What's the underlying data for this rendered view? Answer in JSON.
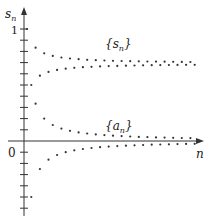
{
  "chart_data": {
    "type": "scatter",
    "title": "",
    "xlabel": "n",
    "ylabel": "s_n",
    "y_tick_labels": [
      "0",
      "1"
    ],
    "ylim": [
      -0.65,
      1.25
    ],
    "x_count": 40,
    "series": [
      {
        "name": "{s_n}",
        "label_text": "{s",
        "label_sub": "n",
        "description": "partial sums of alternating harmonic series, converging to ln 2",
        "formula": "s_n = sum_{k=1..n} (-1)^(k-1)/k"
      },
      {
        "name": "{a_n}",
        "label_text": "{a",
        "label_sub": "n",
        "description": "terms (-1)^(n-1)/n, converging to 0",
        "formula": "a_n = (-1)^(n-1)/n"
      }
    ],
    "sample_values": {
      "s": [
        1,
        0.5,
        0.833,
        0.583,
        0.783,
        0.617,
        0.76,
        0.635,
        0.746,
        0.646
      ],
      "a": [
        1,
        -0.5,
        0.333,
        -0.25,
        0.2,
        -0.167,
        0.143,
        -0.125,
        0.111,
        -0.1
      ]
    },
    "colors": {
      "axis": "#333333",
      "dots": "#333333"
    }
  },
  "labels": {
    "y_axis": "s",
    "y_axis_sub": "n",
    "x_axis": "n",
    "origin": "0",
    "one": "1",
    "s_series": "{s",
    "s_series_sub": "n",
    "s_series_close": "}",
    "a_series": "{a",
    "a_series_sub": "n",
    "a_series_close": "}"
  }
}
